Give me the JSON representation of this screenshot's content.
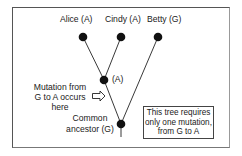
{
  "diagram": {
    "type": "phylogenetic-tree",
    "leaves": [
      {
        "name": "Alice",
        "allele": "A",
        "label": "Alice (A)"
      },
      {
        "name": "Cindy",
        "allele": "A",
        "label": "Cindy (A)"
      },
      {
        "name": "Betty",
        "allele": "G",
        "label": "Betty (G)"
      }
    ],
    "internal_node": {
      "allele": "A",
      "label": "(A)"
    },
    "root": {
      "label_lines": [
        "Common",
        "ancestor (G)"
      ],
      "allele": "G"
    },
    "mutation_annotation": {
      "lines": [
        "Mutation from",
        "G to A occurs",
        "here"
      ],
      "arrow": "right-arrow-icon"
    },
    "note": {
      "lines": [
        "This tree requires",
        "only one mutation,",
        "from G to A"
      ]
    },
    "colors": {
      "node": "#111111",
      "edge": "#222222",
      "frame": "#555555",
      "text": "#1a1a1a"
    }
  }
}
